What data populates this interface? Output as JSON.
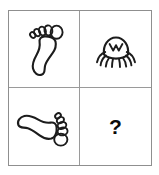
{
  "puzzle": {
    "type": "visual-analogy-matrix",
    "rows": 2,
    "columns": 4,
    "frame_color": "#8f8f8f",
    "grid_line_color": "#9a9a9a",
    "ink_color": "#1c1c1c",
    "background_color": "#ffffff",
    "cells": [
      {
        "position": "top-left",
        "row": 1,
        "column": 1,
        "icon": "footprint-icon",
        "label": "footprint",
        "description": "outline of a left foot with five toes, toes pointing up",
        "rotation_degrees": 0,
        "is_answer_slot": false
      },
      {
        "position": "top-right",
        "row": 1,
        "column": 2,
        "icon": "crab-icon",
        "label": "crab",
        "description": "outline of a crab with domed shell and legs pointing down",
        "rotation_degrees": 0,
        "is_answer_slot": false
      },
      {
        "position": "bottom-left",
        "row": 2,
        "column": 1,
        "icon": "footprint-rotated-icon",
        "label": "footprint rotated",
        "description": "same footprint outline rotated 90 degrees clockwise, toes pointing right",
        "rotation_degrees": 90,
        "is_answer_slot": false
      },
      {
        "position": "bottom-right",
        "row": 2,
        "column": 2,
        "icon": "question-mark-icon",
        "label": "?",
        "description": "missing answer tile marked with a bold question mark",
        "rotation_degrees": null,
        "is_answer_slot": true
      }
    ]
  }
}
